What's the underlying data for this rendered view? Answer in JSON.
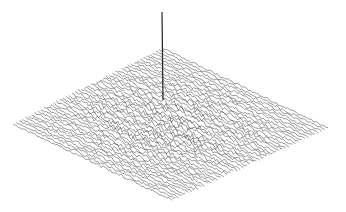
{
  "chart_data": {
    "type": "surface",
    "title": "",
    "xlabel": "",
    "ylabel": "",
    "zlabel": "",
    "grid_size": [
      48,
      48
    ],
    "peak": {
      "x_index": 24,
      "y_index": 24,
      "relative_height": 1.0
    },
    "background_noise_relative_amplitude": 0.06,
    "noise_stronger_near_center": true,
    "projection": {
      "top_corner": [
        162,
        48
      ],
      "left_corner": [
        13,
        124
      ],
      "right_corner": [
        328,
        128
      ],
      "bottom_corner": [
        172,
        200
      ],
      "spike_top": [
        162,
        12
      ],
      "spike_base": [
        163,
        100
      ]
    },
    "colors": {
      "line": "#3a3a3a",
      "background": "#ffffff"
    },
    "axes_visible": false,
    "legend": null
  }
}
